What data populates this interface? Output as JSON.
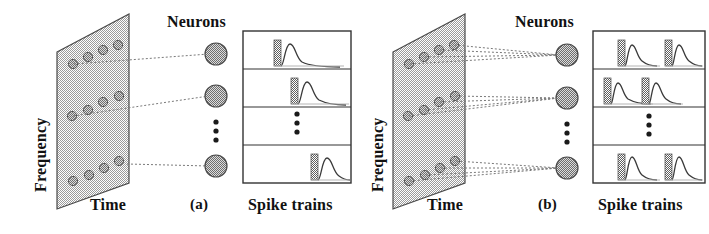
{
  "figure": {
    "type": "diagram",
    "panels": [
      {
        "id": "a",
        "caption": "(a)",
        "axis_y_label": "Frequency",
        "axis_x_label": "Time",
        "neurons_label": "Neurons",
        "spike_label": "Spike trains",
        "plane_points": [
          {
            "t": 0.18,
            "f": 0.78
          },
          {
            "t": 0.38,
            "f": 0.86
          },
          {
            "t": 0.58,
            "f": 0.9
          },
          {
            "t": 0.78,
            "f": 0.94
          },
          {
            "t": 0.14,
            "f": 0.4
          },
          {
            "t": 0.36,
            "f": 0.47
          },
          {
            "t": 0.56,
            "f": 0.53
          },
          {
            "t": 0.76,
            "f": 0.58
          },
          {
            "t": 0.18,
            "f": 0.06
          },
          {
            "t": 0.38,
            "f": 0.11
          },
          {
            "t": 0.58,
            "f": 0.14
          },
          {
            "t": 0.78,
            "f": 0.19
          }
        ],
        "neurons": [
          {
            "index": 1,
            "label": "neuron-1"
          },
          {
            "index": 2,
            "label": "neuron-2"
          },
          {
            "index": 3,
            "label": "neuron-n"
          }
        ],
        "ellipsis": "⋮",
        "connections_per_neuron": 1,
        "spike_rows": [
          {
            "row": 1,
            "spikes": [
              0.34
            ]
          },
          {
            "row": 2,
            "spikes": [
              0.5
            ]
          },
          {
            "row": 3,
            "spikes": []
          },
          {
            "row": 4,
            "spikes": [
              0.72
            ]
          }
        ]
      },
      {
        "id": "b",
        "caption": "(b)",
        "axis_y_label": "Frequency",
        "axis_x_label": "Time",
        "neurons_label": "Neurons",
        "spike_label": "Spike trains",
        "plane_points": [
          {
            "t": 0.18,
            "f": 0.78
          },
          {
            "t": 0.38,
            "f": 0.86
          },
          {
            "t": 0.58,
            "f": 0.9
          },
          {
            "t": 0.78,
            "f": 0.94
          },
          {
            "t": 0.14,
            "f": 0.4
          },
          {
            "t": 0.36,
            "f": 0.47
          },
          {
            "t": 0.56,
            "f": 0.53
          },
          {
            "t": 0.76,
            "f": 0.58
          },
          {
            "t": 0.18,
            "f": 0.06
          },
          {
            "t": 0.38,
            "f": 0.11
          },
          {
            "t": 0.58,
            "f": 0.14
          },
          {
            "t": 0.78,
            "f": 0.19
          }
        ],
        "neurons": [
          {
            "index": 1,
            "label": "neuron-1"
          },
          {
            "index": 2,
            "label": "neuron-2"
          },
          {
            "index": 3,
            "label": "neuron-n"
          }
        ],
        "ellipsis": "⋮",
        "connections_per_neuron": 4,
        "spike_rows": [
          {
            "row": 1,
            "spikes": [
              0.22,
              0.6
            ]
          },
          {
            "row": 2,
            "spikes": [
              0.08,
              0.42
            ]
          },
          {
            "row": 3,
            "spikes": []
          },
          {
            "row": 4,
            "spikes": [
              0.22,
              0.6
            ]
          }
        ]
      }
    ],
    "colors": {
      "ink": "#1a1a1a",
      "plane_fill": "#c9c9c9",
      "dot_fill": "#8c8c8c",
      "neuron_fill": "#9a9a9a",
      "spike_fill": "#9a9a9a",
      "box_stroke": "#333333",
      "background": "#ffffff"
    }
  }
}
